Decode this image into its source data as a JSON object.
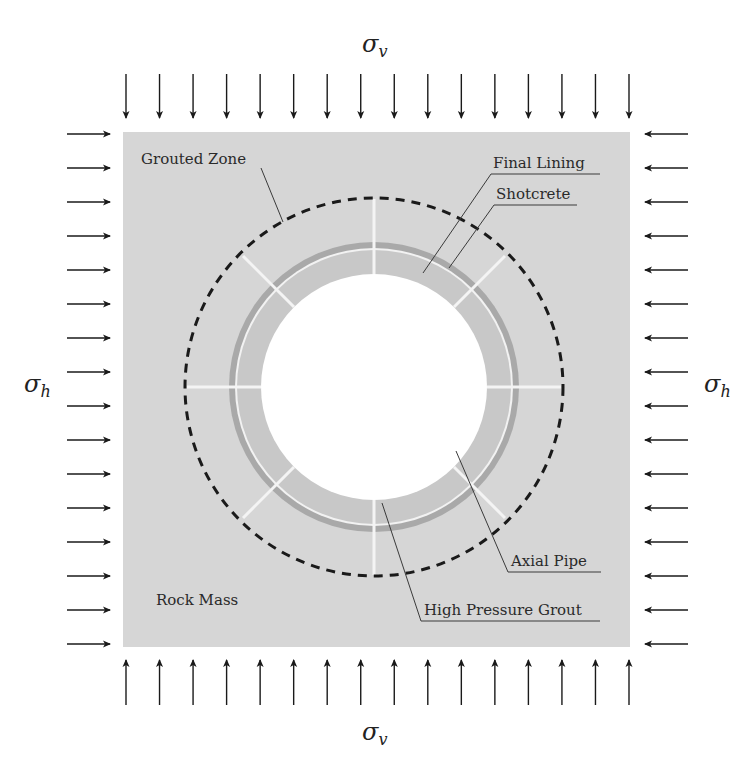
{
  "diagram": {
    "type": "tunnel cross-section",
    "stresses": {
      "top": {
        "symbol": "σ",
        "subscript": "v",
        "arrow_count": 16,
        "direction": "down"
      },
      "bottom": {
        "symbol": "σ",
        "subscript": "v",
        "arrow_count": 16,
        "direction": "up"
      },
      "left": {
        "symbol": "σ",
        "subscript": "h",
        "arrow_count": 16,
        "direction": "right"
      },
      "right": {
        "symbol": "σ",
        "subscript": "h",
        "arrow_count": 16,
        "direction": "left"
      }
    },
    "labels": {
      "grouted_zone": "Grouted Zone",
      "final_lining": "Final Lining",
      "shotcrete": "Shotcrete",
      "axial_pipe": "Axial Pipe",
      "high_pressure_grout": "High Pressure Grout",
      "rock_mass": "Rock Mass"
    },
    "colors": {
      "rock_mass": "#d6d6d6",
      "final_lining": "#c8c8c8",
      "shotcrete": "#a9a9a9",
      "axial_pipe": "#f4f4f4",
      "tunnel_void": "#ffffff",
      "grouted_zone_boundary": "#1a1a1a",
      "arrows": "#1a1a1a"
    },
    "axial_pipe_count": 8
  }
}
